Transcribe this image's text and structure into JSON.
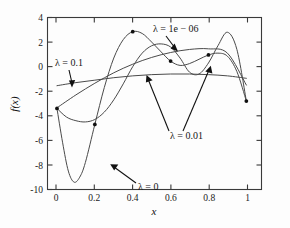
{
  "chart_data": {
    "type": "line",
    "title": "",
    "xlabel": "x",
    "ylabel": "f(x)",
    "xlim": [
      -0.05,
      1.08
    ],
    "ylim": [
      -10,
      4
    ],
    "xticks": [
      0,
      0.2,
      0.4,
      0.6,
      0.8,
      1
    ],
    "xticklabels": [
      "0",
      "0.2",
      "0.4",
      "0.6",
      "0.8",
      "1"
    ],
    "yticks": [
      -10,
      -8,
      -6,
      -4,
      -2,
      0,
      2,
      4
    ],
    "yticklabels": [
      "-10",
      "-8",
      "-6",
      "-4",
      "-2",
      "0",
      "2",
      "4"
    ],
    "grid": false,
    "legend_position": "none",
    "line_color": "#4a4a4a",
    "marker_color": "#101010",
    "data_points": {
      "x": [
        0,
        0.2,
        0.4,
        0.6,
        0.8,
        1
      ],
      "y": [
        -3.4,
        -4.7,
        2.85,
        0.45,
        0.95,
        -2.8
      ]
    },
    "series": [
      {
        "name": "lambda = 0",
        "label": "λ = 0",
        "x": [
          0,
          0.03,
          0.06,
          0.09,
          0.12,
          0.15,
          0.2,
          0.25,
          0.3,
          0.35,
          0.4,
          0.45,
          0.5,
          0.55,
          0.6,
          0.65,
          0.7,
          0.75,
          0.8,
          0.85,
          0.9,
          0.95,
          1
        ],
        "y": [
          -3.4,
          -6.2,
          -8.5,
          -9.4,
          -9.0,
          -7.8,
          -4.7,
          -1.7,
          0.7,
          2.2,
          2.85,
          2.7,
          2.0,
          1.2,
          0.45,
          0.1,
          0.25,
          0.6,
          0.95,
          1.1,
          0.85,
          -0.4,
          -2.8
        ]
      },
      {
        "name": "lambda = 1e-06",
        "label": "λ = 1e − 06",
        "x": [
          0,
          0.05,
          0.1,
          0.15,
          0.2,
          0.25,
          0.3,
          0.35,
          0.4,
          0.45,
          0.5,
          0.55,
          0.6,
          0.65,
          0.7,
          0.75,
          0.8,
          0.85,
          0.9,
          0.95,
          1
        ],
        "y": [
          -3.4,
          -4.1,
          -4.4,
          -4.5,
          -4.3,
          -3.7,
          -2.7,
          -1.4,
          0.0,
          1.1,
          1.7,
          1.85,
          1.6,
          0.7,
          -0.45,
          -0.6,
          0.3,
          1.7,
          2.8,
          1.4,
          -2.8
        ]
      },
      {
        "name": "lambda = 0.01",
        "label": "λ = 0.01",
        "x": [
          0,
          0.1,
          0.2,
          0.3,
          0.4,
          0.5,
          0.6,
          0.7,
          0.8,
          0.9,
          1
        ],
        "y": [
          -3.35,
          -2.3,
          -1.35,
          -0.5,
          0.2,
          0.75,
          1.15,
          1.4,
          1.45,
          1.1,
          -1.5
        ]
      },
      {
        "name": "lambda = 0.1",
        "label": "λ = 0.1",
        "x": [
          0,
          0.1,
          0.2,
          0.3,
          0.4,
          0.5,
          0.6,
          0.7,
          0.8,
          0.9,
          1
        ],
        "y": [
          -1.55,
          -1.3,
          -1.1,
          -0.9,
          -0.75,
          -0.65,
          -0.6,
          -0.6,
          -0.65,
          -0.75,
          -0.95
        ]
      }
    ],
    "annotations": [
      {
        "id": "ann-lambda-01",
        "text": "λ = 0.1",
        "x_px": 55,
        "y_px": 66
      },
      {
        "id": "ann-lambda-1e06",
        "text": "λ = 1e − 06",
        "x_px": 153,
        "y_px": 32
      },
      {
        "id": "ann-lambda-001",
        "text": "λ = 0.01",
        "x_px": 170,
        "y_px": 139
      },
      {
        "id": "ann-lambda-0",
        "text": "λ = 0",
        "x_px": 138,
        "y_px": 190
      }
    ]
  }
}
